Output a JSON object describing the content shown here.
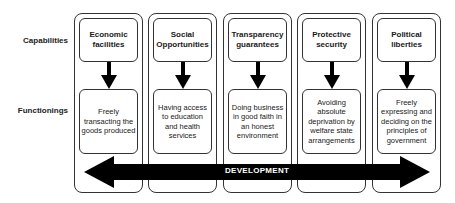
{
  "rows": {
    "capabilities_label": "Capabilities",
    "functionings_label": "Functionings"
  },
  "columns": [
    {
      "capability": "Economic facilities",
      "functioning": "Freely transacting the goods produced"
    },
    {
      "capability": "Social Opportunities",
      "functioning": "Having access to education and health services"
    },
    {
      "capability": "Transparency guarantees",
      "functioning": "Doing business in good faith in an honest environment"
    },
    {
      "capability": "Protective security",
      "functioning": "Avoiding absolute deprivation by welfare state arrangements"
    },
    {
      "capability": "Political liberties",
      "functioning": "Freely expressing and deciding on the principles of government"
    }
  ],
  "development_arrow": {
    "label": "DEVELOPMENT",
    "direction": "bidirectional",
    "color": "#000000"
  },
  "colors": {
    "stroke": "#333333",
    "arrow_fill": "#000000",
    "background": "#ffffff"
  }
}
